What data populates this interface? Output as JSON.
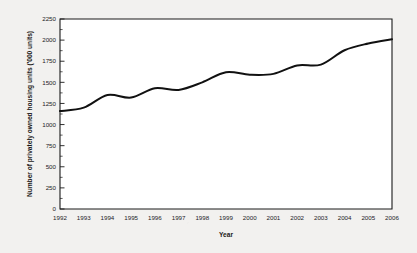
{
  "chart_data": {
    "type": "line",
    "title": "",
    "subtitle": "",
    "xlabel": "Year",
    "ylabel": "Number of privately owned housing units ('000 units)",
    "categories": [
      "1992",
      "1993",
      "1994",
      "1995",
      "1996",
      "1997",
      "1998",
      "1999",
      "2000",
      "2001",
      "2002",
      "2003",
      "2004",
      "2005",
      "2006"
    ],
    "x": [
      1992,
      1993,
      1994,
      1995,
      1996,
      1997,
      1998,
      1999,
      2000,
      2001,
      2002,
      2003,
      2004,
      2005,
      2006
    ],
    "values": [
      1160,
      1200,
      1350,
      1320,
      1430,
      1410,
      1500,
      1620,
      1590,
      1600,
      1700,
      1710,
      1880,
      1960,
      2010
    ],
    "series": [
      {
        "name": "Privately owned housing units",
        "values": [
          1160,
          1200,
          1350,
          1320,
          1430,
          1410,
          1500,
          1620,
          1590,
          1600,
          1700,
          1710,
          1880,
          1960,
          2010
        ]
      }
    ],
    "ylim": [
      0,
      2250
    ],
    "xlim": [
      1992,
      2006
    ],
    "ytick_labels": [
      "0",
      "250",
      "500",
      "750",
      "1000",
      "1250",
      "1500",
      "1750",
      "2000",
      "2250"
    ],
    "ytick_values": [
      0,
      250,
      500,
      750,
      1000,
      1250,
      1500,
      1750,
      2000,
      2250
    ],
    "ytick_step": 250,
    "yminor_step": 125,
    "xtick_labels": [
      "1992",
      "1993",
      "1994",
      "1995",
      "1996",
      "1997",
      "1998",
      "1999",
      "2000",
      "2001",
      "2002",
      "2003",
      "2004",
      "2005",
      "2006"
    ],
    "grid": false,
    "legend": false,
    "legend_position": "none",
    "line_color": "#111111",
    "axis_color": "#1a1a1a",
    "background_color": "#f2f1ef",
    "plot_background_color": "#ffffff",
    "annotations": []
  }
}
